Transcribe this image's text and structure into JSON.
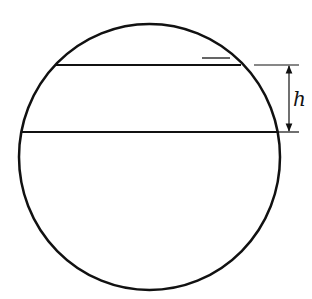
{
  "diagram": {
    "type": "sphere-cross-section-with-slab",
    "circle": {
      "cx": 149.5,
      "cy": 157,
      "rx": 130.5,
      "ry": 133
    },
    "chords": [
      {
        "name": "top-chord",
        "y": 65,
        "x1": 55,
        "x2": 241
      },
      {
        "name": "bottom-chord",
        "y": 132,
        "x1": 22,
        "x2": 277
      }
    ],
    "dimension": {
      "label": "h",
      "x": 289,
      "y_top": 65,
      "y_bottom": 132,
      "ext_top": {
        "x1": 254,
        "x2": 299
      },
      "ext_bottom": {
        "x1": 278,
        "x2": 299
      }
    },
    "small_mark": {
      "x1": 202,
      "x2": 230,
      "y": 58
    },
    "stroke_color": "#111111",
    "background_color": "#ffffff"
  }
}
